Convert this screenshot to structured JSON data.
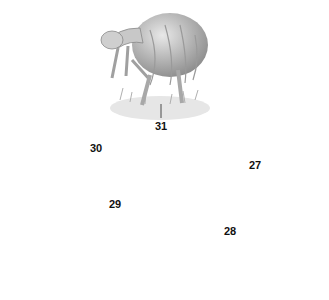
{
  "diagram": {
    "type": "life-cycle",
    "stages": [
      {
        "id": "human-host",
        "label": "31",
        "description": "person bending in flooded field"
      },
      {
        "id": "adult-worms",
        "label": "",
        "description": "paired adult worms"
      },
      {
        "id": "egg",
        "label": "27",
        "description": "egg containing embryo"
      },
      {
        "id": "miracidium",
        "label": "28",
        "description": "ciliated larva"
      },
      {
        "id": "snail-host",
        "label": "29",
        "description": "intermediate snail host"
      },
      {
        "id": "cercaria",
        "label": "30",
        "description": "fork-tailed cercaria"
      }
    ],
    "arrow_color": "#7a7a7a"
  }
}
